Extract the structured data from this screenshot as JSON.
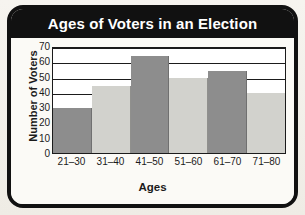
{
  "card": {
    "title": "Ages of Voters in an Election",
    "border_color": "#111111",
    "title_band_color": "#111111",
    "title_text_color": "#ffffff",
    "plot_background": "#ffffff",
    "page_background": "#f3f1ec"
  },
  "chart_data": {
    "type": "bar",
    "title": "Ages of Voters in an Election",
    "xlabel": "Ages",
    "ylabel": "Number of Voters",
    "categories": [
      "21–30",
      "31–40",
      "41–50",
      "51–60",
      "61–70",
      "71–80"
    ],
    "values": [
      30,
      45,
      65,
      50,
      55,
      40
    ],
    "bar_colors": [
      "#8d8d8d",
      "#d2d2cd",
      "#8d8d8d",
      "#d2d2cd",
      "#8d8d8d",
      "#d2d2cd"
    ],
    "ylim": [
      0,
      70
    ],
    "yticks": [
      0,
      10,
      20,
      30,
      40,
      50,
      60,
      70
    ],
    "ytick_labels": [
      "0",
      "10",
      "20",
      "30",
      "40",
      "50",
      "60",
      "70"
    ],
    "gridlines": [
      10,
      20,
      30,
      40,
      50,
      60,
      70
    ],
    "grid": true,
    "legend": false,
    "bar_gap": 0
  }
}
